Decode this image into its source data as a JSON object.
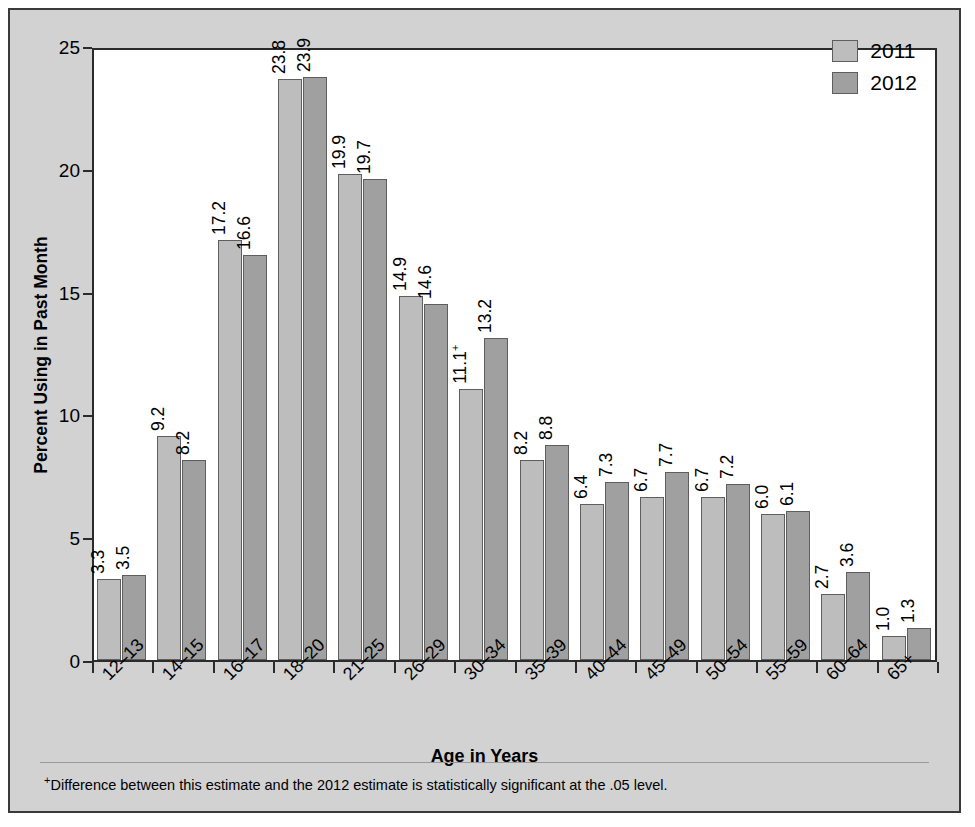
{
  "chart_data": {
    "type": "bar",
    "title": "",
    "xlabel": "Age in Years",
    "ylabel": "Percent Using in Past Month",
    "ylim": [
      0,
      25
    ],
    "yticks": [
      0,
      5,
      10,
      15,
      20,
      25
    ],
    "grid": false,
    "legend_position": "top-right",
    "categories": [
      "12–13",
      "14–15",
      "16–17",
      "18–20",
      "21–25",
      "26–29",
      "30–34",
      "35–39",
      "40–44",
      "45–49",
      "50–54",
      "55–59",
      "60–64",
      "65+"
    ],
    "series": [
      {
        "name": "2011",
        "color": "#bdbdbd",
        "values": [
          3.3,
          9.2,
          17.2,
          23.8,
          19.9,
          14.9,
          11.1,
          8.2,
          6.4,
          6.7,
          6.7,
          6.0,
          2.7,
          1.0
        ],
        "labels": [
          "3.3",
          "9.2",
          "17.2",
          "23.8",
          "19.9",
          "14.9",
          "11.1",
          "8.2",
          "6.4",
          "6.7",
          "6.7",
          "6.0",
          "2.7",
          "1.0"
        ],
        "significance_marker": [
          "",
          "",
          "",
          "",
          "",
          "",
          "+",
          "",
          "",
          "",
          "",
          "",
          "",
          ""
        ]
      },
      {
        "name": "2012",
        "color": "#a0a0a0",
        "values": [
          3.5,
          8.2,
          16.6,
          23.9,
          19.7,
          14.6,
          13.2,
          8.8,
          7.3,
          7.7,
          7.2,
          6.1,
          3.6,
          1.3
        ],
        "labels": [
          "3.5",
          "8.2",
          "16.6",
          "23.9",
          "19.7",
          "14.6",
          "13.2",
          "8.8",
          "7.3",
          "7.7",
          "7.2",
          "6.1",
          "3.6",
          "1.3"
        ],
        "significance_marker": [
          "",
          "",
          "",
          "",
          "",
          "",
          "",
          "",
          "",
          "",
          "",
          "",
          "",
          ""
        ]
      }
    ],
    "marker_symbol": "+",
    "footnote": "Difference between this estimate and the 2012 estimate is statistically significant at the .05 level."
  },
  "legend": {
    "items": [
      {
        "label": "2011",
        "color": "#bdbdbd"
      },
      {
        "label": "2012",
        "color": "#a0a0a0"
      }
    ]
  },
  "axis": {
    "y_title": "Percent Using in Past Month",
    "x_title": "Age in Years",
    "y_tick_labels": [
      "0",
      "5",
      "10",
      "15",
      "20",
      "25"
    ]
  },
  "footnote": {
    "marker": "+",
    "text": "Difference between this estimate and the 2012 estimate is statistically significant at the .05 level."
  }
}
